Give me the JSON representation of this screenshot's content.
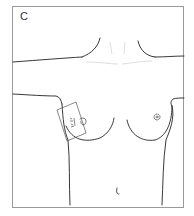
{
  "figure": {
    "panel_label": "C",
    "markings": [
      {
        "type": "rectangle",
        "location": "right lateral breast / axilla",
        "annotation": "handwritten marks (illegible)"
      }
    ],
    "colors": {
      "line": "#222222",
      "frame": "#9a9a9a",
      "faint": "#c8c8c8",
      "background": "#ffffff"
    }
  }
}
